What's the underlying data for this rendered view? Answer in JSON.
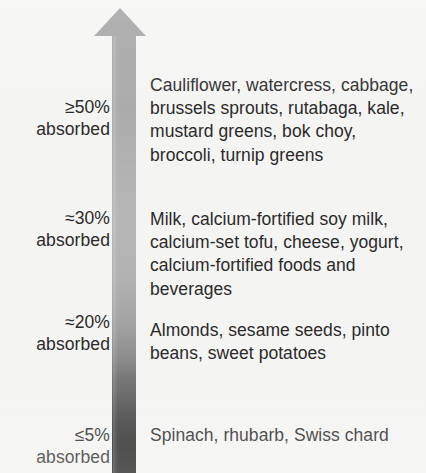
{
  "figure": {
    "background_color": "#f4f4f2",
    "text_color": "#2b2b2b"
  },
  "arrow": {
    "name": "upward-gradient-arrow",
    "direction": "up",
    "meaning": "absorption rate increases upward",
    "gradient_top_color": "#8f8f8f",
    "gradient_mid_color": "#b4b4b4",
    "gradient_bottom_color": "#141414",
    "tip_y": 8,
    "head_left_x": 94,
    "head_right_x": 146,
    "shaft_left_x": 113,
    "shaft_right_x": 134,
    "base_y": 473
  },
  "tiers": [
    {
      "percent": "≥50%",
      "absorbed": "absorbed",
      "foods": "Cauliflower, watercress, cabbage, brussels sprouts, rutabaga, kale, mustard greens, bok choy, broccoli, turnip greens"
    },
    {
      "percent": "≈30%",
      "absorbed": "absorbed",
      "foods": "Milk, calcium-fortified soy milk, calcium-set tofu, cheese, yogurt, calcium-fortified foods and beverages"
    },
    {
      "percent": "≈20%",
      "absorbed": "absorbed",
      "foods": "Almonds, sesame seeds, pinto beans, sweet potatoes"
    },
    {
      "percent": "≤5%",
      "absorbed": "absorbed",
      "foods": "Spinach, rhubarb, Swiss chard"
    }
  ]
}
